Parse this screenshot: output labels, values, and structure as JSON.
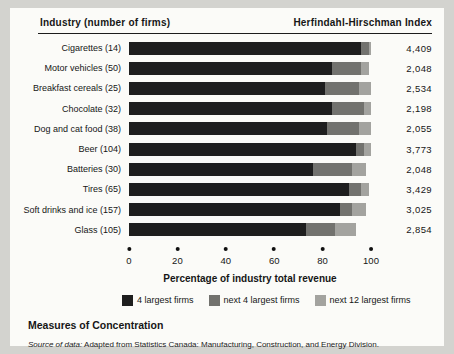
{
  "page": {
    "background_color": "#d3d3cf",
    "panel_color": "#fbfbf8"
  },
  "header": {
    "left": "Industry (number of firms)",
    "right": "Herfindahl-Hirschman Index"
  },
  "source": {
    "label": "Source of data:",
    "text": " Adapted from Statistics Canada: Manufacturing, Construction, and Energy Division."
  },
  "chart_data": {
    "type": "bar",
    "orientation": "horizontal-stacked",
    "title": "Measures of Concentration",
    "xlabel": "Percentage of industry total revenue",
    "xlim": [
      0,
      100
    ],
    "xticks": [
      0,
      20,
      40,
      60,
      80,
      100
    ],
    "grid": false,
    "legend_position": "bottom",
    "categories": [
      "Cigarettes (14)",
      "Motor vehicles (50)",
      "Breakfast cereals (25)",
      "Chocolate (32)",
      "Dog and cat food (38)",
      "Beer (104)",
      "Batteries (30)",
      "Tires (65)",
      "Soft drinks and ice (157)",
      "Glass (105)"
    ],
    "herfindahl_hirschman_index": [
      "4,409",
      "2,048",
      "2,534",
      "2,198",
      "2,055",
      "3,773",
      "2,048",
      "3,429",
      "3,025",
      "2,854"
    ],
    "series": [
      {
        "name": "4 largest firms",
        "color": "#1e1e1e",
        "values": [
          96,
          84,
          81,
          84,
          82,
          94,
          76,
          91,
          87,
          73
        ]
      },
      {
        "name": "next 4 largest firms",
        "color": "#72726e",
        "values": [
          3,
          12,
          14,
          13,
          13,
          3,
          16,
          5,
          5,
          12
        ]
      },
      {
        "name": "next 12 largest firms",
        "color": "#a3a39f",
        "values": [
          1,
          3,
          5,
          3,
          5,
          3,
          6,
          3,
          6,
          9
        ]
      }
    ]
  }
}
